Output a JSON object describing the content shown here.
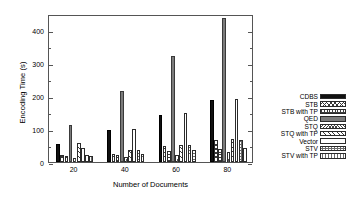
{
  "chart_data": {
    "type": "bar",
    "title": "",
    "xlabel": "Number of Documents",
    "ylabel": "Encoding Time (s)",
    "categories": [
      "20",
      "40",
      "60",
      "80"
    ],
    "ylim": [
      0,
      450
    ],
    "yticks": [
      0,
      100,
      200,
      300,
      400
    ],
    "ytick_labels": [
      "0",
      "100",
      "200",
      "300",
      "400"
    ],
    "grid": false,
    "legend_position": "right-outside",
    "series": [
      {
        "name": "CDBS",
        "pattern": "solid-black",
        "values": [
          55,
          98,
          144,
          190
        ]
      },
      {
        "name": "STB",
        "pattern": "crosshatch",
        "values": [
          21,
          24,
          50,
          66
        ]
      },
      {
        "name": "STB with TP",
        "pattern": "dots-dense",
        "values": [
          18,
          22,
          35,
          41
        ]
      },
      {
        "name": "QED",
        "pattern": "solid-gray",
        "values": [
          112,
          217,
          322,
          437
        ]
      },
      {
        "name": "STQ",
        "pattern": "crosshatch-fine",
        "values": [
          12,
          15,
          22,
          29
        ]
      },
      {
        "name": "STQ with TP",
        "pattern": "diag",
        "values": [
          57,
          36,
          53,
          69
        ]
      },
      {
        "name": "Vector",
        "pattern": "empty",
        "values": [
          44,
          101,
          150,
          193
        ]
      },
      {
        "name": "STV",
        "pattern": "dots-fine",
        "values": [
          21,
          37,
          51,
          68
        ]
      },
      {
        "name": "STV with TP",
        "pattern": "dots-fine",
        "values": [
          17,
          24,
          37,
          42
        ]
      }
    ]
  },
  "legend": {
    "items": [
      {
        "label": "CDBS"
      },
      {
        "label": "STB"
      },
      {
        "label": "STB with TP"
      },
      {
        "label": "QED"
      },
      {
        "label": "STQ"
      },
      {
        "label": "STQ with TP"
      },
      {
        "label": "Vector"
      },
      {
        "label": "STV"
      },
      {
        "label": "STV with TP"
      }
    ]
  },
  "colors": {
    "cdbs": "#111111",
    "qed": "#7b7b7b",
    "axis": "#555555",
    "background": "#ffffff"
  }
}
